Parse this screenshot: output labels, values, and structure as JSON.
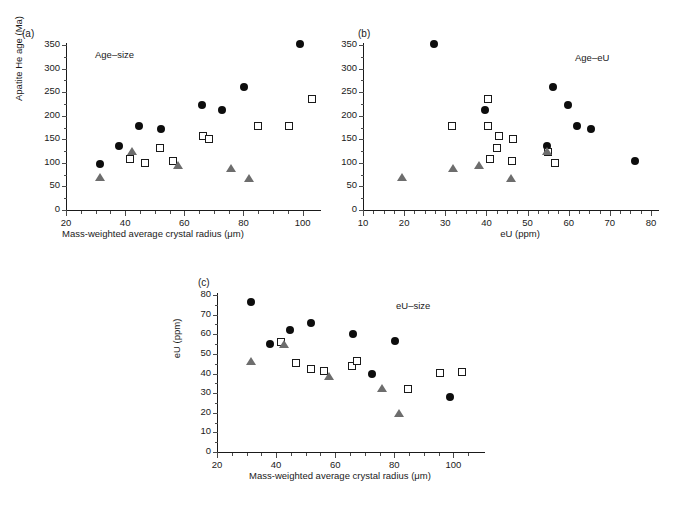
{
  "figure": {
    "background": "#ffffff",
    "marker_colors": {
      "circle": "#0d0d0d",
      "square_edge": "#1a1a1a",
      "triangle": "#6d6d6d"
    }
  },
  "panels": [
    {
      "letter": "(a)",
      "series_label": "Age–size",
      "xlabel": "Mass-weighted average crystal radius (μm)",
      "ylabel": "Apatite He age (Ma)",
      "xticks": [
        "20",
        "40",
        "60",
        "80",
        "100"
      ],
      "yticks": [
        "0",
        "50",
        "100",
        "150",
        "200",
        "250",
        "300",
        "350"
      ]
    },
    {
      "letter": "(b)",
      "series_label": "Age–eU",
      "xlabel": "eU (ppm)",
      "ylabel": "",
      "xticks": [
        "10",
        "20",
        "30",
        "40",
        "50",
        "60",
        "70",
        "80"
      ],
      "yticks": [
        "0",
        "50",
        "100",
        "150",
        "200",
        "250",
        "300",
        "350"
      ]
    },
    {
      "letter": "(c)",
      "series_label": "eU–size",
      "xlabel": "Mass-weighted average crystal radius (μm)",
      "ylabel": "eU (ppm)",
      "xticks": [
        "20",
        "40",
        "60",
        "80",
        "100"
      ],
      "yticks": [
        "0",
        "10",
        "20",
        "30",
        "40",
        "50",
        "60",
        "70",
        "80"
      ]
    }
  ],
  "chart_data": [
    {
      "type": "scatter",
      "panel": "a",
      "title": "Age–size",
      "xlabel": "Mass-weighted average crystal radius (μm)",
      "ylabel": "Apatite He age (Ma)",
      "xlim": [
        20,
        107
      ],
      "ylim": [
        0,
        360
      ],
      "xticks": [
        20,
        40,
        60,
        80,
        100
      ],
      "yticks": [
        0,
        50,
        100,
        150,
        200,
        250,
        300,
        350
      ],
      "grid": false,
      "legend": "none",
      "series": [
        {
          "name": "filled-circle",
          "marker": "circle",
          "points": [
            [
              31.5,
              98
            ],
            [
              38.0,
              136
            ],
            [
              44.6,
              178
            ],
            [
              52.0,
              172
            ],
            [
              66.0,
              223
            ],
            [
              72.6,
              212
            ],
            [
              80.2,
              260
            ],
            [
              99.0,
              352
            ]
          ]
        },
        {
          "name": "open-square",
          "marker": "square",
          "points": [
            [
              41.8,
              108
            ],
            [
              46.8,
              100
            ],
            [
              51.8,
              131
            ],
            [
              56.2,
              103
            ],
            [
              66.2,
              158
            ],
            [
              68.4,
              150
            ],
            [
              85.0,
              179
            ],
            [
              95.4,
              178
            ],
            [
              103.0,
              235
            ]
          ]
        },
        {
          "name": "grey-triangle",
          "marker": "triangle",
          "points": [
            [
              31.6,
              67
            ],
            [
              42.4,
              122
            ],
            [
              58.0,
              93
            ],
            [
              75.8,
              87
            ],
            [
              81.8,
              66
            ]
          ]
        }
      ]
    },
    {
      "type": "scatter",
      "panel": "b",
      "title": "Age–eU",
      "xlabel": "eU (ppm)",
      "ylabel": "Apatite He age (Ma)",
      "xlim": [
        7,
        80
      ],
      "ylim": [
        0,
        360
      ],
      "xticks": [
        10,
        20,
        30,
        40,
        50,
        60,
        70,
        80
      ],
      "yticks": [
        0,
        50,
        100,
        150,
        200,
        250,
        300,
        350
      ],
      "grid": false,
      "legend": "none",
      "series": [
        {
          "name": "filled-circle",
          "marker": "circle",
          "points": [
            [
              27.3,
              352
            ],
            [
              39.7,
              212
            ],
            [
              56.3,
              260
            ],
            [
              59.8,
              223
            ],
            [
              62.0,
              178
            ],
            [
              65.4,
              172
            ],
            [
              54.8,
              136
            ],
            [
              76.1,
              104
            ]
          ]
        },
        {
          "name": "open-square",
          "marker": "square",
          "points": [
            [
              31.7,
              179
            ],
            [
              40.4,
              235
            ],
            [
              40.3,
              178
            ],
            [
              43.0,
              158
            ],
            [
              42.6,
              131
            ],
            [
              46.4,
              150
            ],
            [
              40.8,
              108
            ],
            [
              46.3,
              103
            ],
            [
              55.0,
              122
            ],
            [
              56.6,
              100
            ]
          ]
        },
        {
          "name": "grey-triangle",
          "marker": "triangle",
          "points": [
            [
              19.5,
              67
            ],
            [
              31.9,
              87
            ],
            [
              38.2,
              93
            ],
            [
              46.0,
              66
            ],
            [
              54.8,
              122
            ]
          ]
        }
      ]
    },
    {
      "type": "scatter",
      "panel": "c",
      "title": "eU–size",
      "xlabel": "Mass-weighted average crystal radius (μm)",
      "ylabel": "eU (ppm)",
      "xlim": [
        20,
        107
      ],
      "ylim": [
        0,
        82
      ],
      "xticks": [
        20,
        40,
        60,
        80,
        100
      ],
      "yticks": [
        0,
        10,
        20,
        30,
        40,
        50,
        60,
        70,
        80
      ],
      "grid": false,
      "legend": "none",
      "series": [
        {
          "name": "filled-circle",
          "marker": "circle",
          "points": [
            [
              31.6,
              76.2
            ],
            [
              38.0,
              55.2
            ],
            [
              44.6,
              62.1
            ],
            [
              51.8,
              65.6
            ],
            [
              66.0,
              59.9
            ],
            [
              72.6,
              40.0
            ],
            [
              80.2,
              56.5
            ],
            [
              99.0,
              28.2
            ]
          ]
        },
        {
          "name": "open-square",
          "marker": "square",
          "points": [
            [
              41.5,
              56.3
            ],
            [
              46.6,
              45.1
            ],
            [
              51.8,
              42.5
            ],
            [
              56.2,
              41.2
            ],
            [
              65.8,
              43.6
            ],
            [
              67.4,
              46.6
            ],
            [
              84.8,
              32.0
            ],
            [
              95.4,
              40.3
            ],
            [
              103.0,
              41.0
            ]
          ]
        },
        {
          "name": "grey-triangle",
          "marker": "triangle",
          "points": [
            [
              31.6,
              45.8
            ],
            [
              42.6,
              54.6
            ],
            [
              57.8,
              38.4
            ],
            [
              75.8,
              32.0
            ],
            [
              81.5,
              19.4
            ]
          ]
        }
      ]
    }
  ]
}
